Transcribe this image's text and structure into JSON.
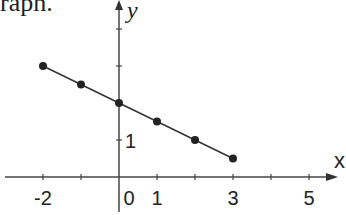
{
  "caption": "raph.",
  "chart_data": {
    "type": "line",
    "title": "",
    "xlabel": "x",
    "ylabel": "y",
    "x_tick_labels": [
      "-2",
      "0",
      "1",
      "3",
      "5"
    ],
    "y_tick_labels": [
      "1"
    ],
    "x": [
      -2,
      -1,
      0,
      1,
      2,
      3
    ],
    "series": [
      {
        "name": "line",
        "values": [
          3.0,
          2.5,
          2.0,
          1.5,
          1.0,
          0.5
        ]
      }
    ],
    "xlim": [
      -2.8,
      5.8
    ],
    "ylim": [
      -1,
      4.8
    ],
    "grid": false,
    "markers": true
  }
}
